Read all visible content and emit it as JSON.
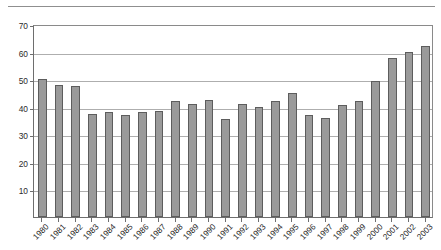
{
  "chart_data": {
    "type": "bar",
    "title": "",
    "subtitle": "",
    "xlabel": "",
    "ylabel": "",
    "ylim": [
      0,
      70
    ],
    "ytick_values": [
      10,
      20,
      30,
      40,
      50,
      60,
      70
    ],
    "ytick_labels": [
      "10",
      "20",
      "30",
      "40",
      "50",
      "60",
      "70"
    ],
    "grid": true,
    "legend": false,
    "legend_position": "none",
    "bar_color": "#9a9a9a",
    "bar_edge_color": "#5d5d5d",
    "gridline_color": "#aeaeae",
    "axis_color": "#6e6e6e",
    "categories": [
      "1980",
      "1981",
      "1982",
      "1983",
      "1984",
      "1985",
      "1986",
      "1987",
      "1988",
      "1989",
      "1990",
      "1991",
      "1992",
      "1993",
      "1994",
      "1995",
      "1996",
      "1997",
      "1998",
      "1999",
      "2000",
      "2001",
      "2002",
      "2003"
    ],
    "values": [
      50,
      48,
      47.5,
      37.5,
      38,
      37,
      38,
      38.5,
      42,
      41,
      42.5,
      35.5,
      41,
      40,
      42,
      45,
      37,
      36,
      40.5,
      42,
      49.5,
      57.5,
      60,
      62
    ]
  }
}
